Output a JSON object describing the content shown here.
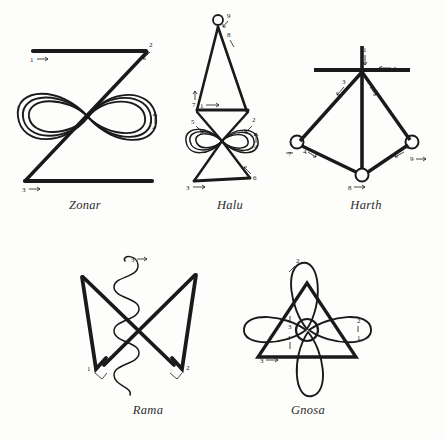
{
  "page": {
    "background_color": "#fdfdfc",
    "ink_color": "#1a1a1a",
    "width": 446,
    "height": 439
  },
  "symbols": [
    {
      "id": "zonar",
      "caption": "Zonar",
      "stroke_labels": [
        {
          "n": "1",
          "arrow": "right",
          "x": 33,
          "y": 58
        },
        {
          "n": "2",
          "arrow": "down-left",
          "x": 148,
          "y": 46
        },
        {
          "n": "4",
          "arrow": "up",
          "x": 152,
          "y": 126
        },
        {
          "n": "3",
          "arrow": "right",
          "x": 25,
          "y": 186
        }
      ],
      "parts": [
        "top-horizontal-bar",
        "diagonal-stroke",
        "triple-infinity-loops",
        "bottom-horizontal-bar"
      ]
    },
    {
      "id": "halu",
      "caption": "Halu",
      "stroke_labels": [
        {
          "n": "9",
          "arrow": "down-left",
          "x": 229,
          "y": 16
        },
        {
          "n": "8",
          "arrow": "down-right",
          "x": 229,
          "y": 35
        },
        {
          "n": "7",
          "arrow": "up",
          "x": 194,
          "y": 103
        },
        {
          "n": "1",
          "arrow": "right",
          "x": 200,
          "y": 112
        },
        {
          "n": "5",
          "arrow": "down-right",
          "x": 193,
          "y": 122
        },
        {
          "n": "2",
          "arrow": "down-left",
          "x": 252,
          "y": 121
        },
        {
          "n": "4",
          "arrow": "up",
          "x": 254,
          "y": 145
        },
        {
          "n": "6",
          "arrow": "up-left",
          "x": 253,
          "y": 177
        },
        {
          "n": "3",
          "arrow": "right",
          "x": 188,
          "y": 185
        }
      ],
      "parts": [
        "top-circle",
        "tall-triangle",
        "middle-horizontal-bar",
        "infinity-loops",
        "lower-triangle"
      ]
    },
    {
      "id": "harth",
      "caption": "Harth",
      "stroke_labels": [
        {
          "n": "1",
          "arrow": "down",
          "x": 364,
          "y": 50
        },
        {
          "n": "2",
          "arrow": "left",
          "x": 390,
          "y": 69
        },
        {
          "n": "3",
          "arrow": "down-left",
          "x": 344,
          "y": 83
        },
        {
          "n": "5",
          "arrow": "down-right",
          "x": 367,
          "y": 83
        },
        {
          "n": "7",
          "arrow": "left",
          "x": 290,
          "y": 153
        },
        {
          "n": "4",
          "arrow": "down-left",
          "x": 304,
          "y": 150
        },
        {
          "n": "6",
          "arrow": "down-left",
          "x": 407,
          "y": 146
        },
        {
          "n": "9",
          "arrow": "right",
          "x": 411,
          "y": 157
        },
        {
          "n": "8",
          "arrow": "right",
          "x": 353,
          "y": 184
        }
      ],
      "parts": [
        "vertical-stem",
        "horizontal-crossbar",
        "left-diagonal",
        "right-diagonal",
        "left-circle",
        "right-circle",
        "bottom-circle",
        "lower-left-edge",
        "lower-right-edge"
      ]
    },
    {
      "id": "rama",
      "caption": "Rama",
      "stroke_labels": [
        {
          "n": "3",
          "arrow": "right",
          "x": 133,
          "y": 260
        },
        {
          "n": "1",
          "arrow": "down-right",
          "x": 92,
          "y": 368
        },
        {
          "n": "2",
          "arrow": "down-left",
          "x": 181,
          "y": 367
        }
      ],
      "parts": [
        "left-v-stroke",
        "right-v-stroke",
        "vertical-coil-spiral"
      ]
    },
    {
      "id": "gnosa",
      "caption": "Gnosa",
      "stroke_labels": [
        {
          "n": "2",
          "arrow": "down-left",
          "x": 293,
          "y": 260
        },
        {
          "n": "3",
          "arrow": "up",
          "x": 287,
          "y": 330
        },
        {
          "n": "4",
          "arrow": "down",
          "x": 286,
          "y": 339
        },
        {
          "n": "2",
          "arrow": "down-left",
          "x": 354,
          "y": 322
        },
        {
          "n": "1",
          "arrow": "none",
          "x": 355,
          "y": 337
        },
        {
          "n": "3",
          "arrow": "right",
          "x": 260,
          "y": 354
        }
      ],
      "parts": [
        "triangle",
        "four-petals",
        "center-circle"
      ]
    }
  ]
}
